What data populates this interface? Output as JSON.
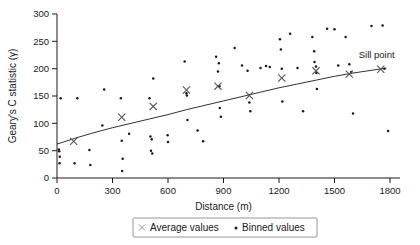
{
  "figure": {
    "title": "",
    "annotation": {
      "sill_point_label": "Sill point"
    }
  },
  "axes": {
    "x": {
      "label": "Distance (m)",
      "ticks": [
        "0",
        "300",
        "600",
        "900",
        "1200",
        "1500",
        "1800"
      ],
      "min": 0,
      "max": 1800
    },
    "y": {
      "label": "Geary's C statistic (γ)",
      "ticks": [
        "0",
        "50",
        "100",
        "150",
        "200",
        "250",
        "300"
      ],
      "min": 0,
      "max": 300
    }
  },
  "legend": {
    "items": [
      {
        "marker": "cross-marker",
        "symbol": "×",
        "label": "Average values"
      },
      {
        "marker": "dot-marker",
        "symbol": "•",
        "label": "Binned values"
      }
    ]
  },
  "colors": {
    "axis": "#1a1a1a",
    "curve": "#1a1a1a",
    "binned_point": "#1a1a1a",
    "average_marker": "#555555",
    "legend_border": "#8a8a8a",
    "background": "#ffffff"
  },
  "chart_data": {
    "type": "scatter",
    "title": "",
    "xlabel": "Distance (m)",
    "ylabel": "Geary's C statistic (γ)",
    "xlim": [
      0,
      1800
    ],
    "ylim": [
      0,
      300
    ],
    "xticks": [
      0,
      300,
      600,
      900,
      1200,
      1500,
      1800
    ],
    "yticks": [
      0,
      50,
      100,
      150,
      200,
      250,
      300
    ],
    "grid": false,
    "legend_position": "bottom-center",
    "series": [
      {
        "name": "Average values",
        "marker": "x",
        "points": [
          [
            90,
            67
          ],
          [
            350,
            111
          ],
          [
            520,
            131
          ],
          [
            700,
            161
          ],
          [
            870,
            168
          ],
          [
            1040,
            151
          ],
          [
            1215,
            183
          ],
          [
            1400,
            196
          ],
          [
            1580,
            190
          ],
          [
            1750,
            199
          ]
        ]
      },
      {
        "name": "Binned values",
        "marker": "dot",
        "points": [
          [
            10,
            52
          ],
          [
            12,
            49
          ],
          [
            15,
            39
          ],
          [
            14,
            27
          ],
          [
            20,
            146
          ],
          [
            95,
            27
          ],
          [
            110,
            146
          ],
          [
            175,
            51
          ],
          [
            180,
            24
          ],
          [
            245,
            96
          ],
          [
            255,
            162
          ],
          [
            345,
            146
          ],
          [
            350,
            68
          ],
          [
            355,
            35
          ],
          [
            352,
            13
          ],
          [
            390,
            81
          ],
          [
            500,
            146
          ],
          [
            505,
            76
          ],
          [
            512,
            71
          ],
          [
            508,
            50
          ],
          [
            515,
            45
          ],
          [
            520,
            182
          ],
          [
            600,
            66
          ],
          [
            598,
            78
          ],
          [
            690,
            213
          ],
          [
            700,
            155
          ],
          [
            702,
            151
          ],
          [
            705,
            106
          ],
          [
            760,
            87
          ],
          [
            790,
            67
          ],
          [
            860,
            222
          ],
          [
            870,
            195
          ],
          [
            875,
            210
          ],
          [
            878,
            168
          ],
          [
            880,
            128
          ],
          [
            886,
            112
          ],
          [
            960,
            238
          ],
          [
            1000,
            206
          ],
          [
            1030,
            196
          ],
          [
            1040,
            138
          ],
          [
            1045,
            122
          ],
          [
            1100,
            201
          ],
          [
            1130,
            205
          ],
          [
            1150,
            203
          ],
          [
            1205,
            254
          ],
          [
            1210,
            235
          ],
          [
            1215,
            200
          ],
          [
            1218,
            140
          ],
          [
            1260,
            264
          ],
          [
            1300,
            201
          ],
          [
            1330,
            122
          ],
          [
            1380,
            258
          ],
          [
            1390,
            232
          ],
          [
            1392,
            212
          ],
          [
            1400,
            204
          ],
          [
            1402,
            192
          ],
          [
            1405,
            163
          ],
          [
            1460,
            273
          ],
          [
            1500,
            272
          ],
          [
            1520,
            206
          ],
          [
            1560,
            258
          ],
          [
            1580,
            208
          ],
          [
            1590,
            194
          ],
          [
            1600,
            118
          ],
          [
            1700,
            278
          ],
          [
            1760,
            279
          ],
          [
            1770,
            200
          ],
          [
            1790,
            86
          ]
        ]
      }
    ],
    "fit_curve": {
      "name": "Fitted variogram model",
      "points": [
        [
          0,
          62
        ],
        [
          100,
          73
        ],
        [
          200,
          83
        ],
        [
          300,
          92
        ],
        [
          400,
          100
        ],
        [
          500,
          108
        ],
        [
          600,
          116
        ],
        [
          700,
          125
        ],
        [
          800,
          133
        ],
        [
          900,
          141
        ],
        [
          1000,
          149
        ],
        [
          1100,
          157
        ],
        [
          1200,
          165
        ],
        [
          1300,
          172
        ],
        [
          1400,
          179
        ],
        [
          1500,
          186
        ],
        [
          1600,
          192
        ],
        [
          1700,
          197
        ],
        [
          1780,
          201
        ]
      ]
    },
    "annotations": [
      {
        "text": "Sill point",
        "x": 1750,
        "y": 199
      }
    ]
  }
}
